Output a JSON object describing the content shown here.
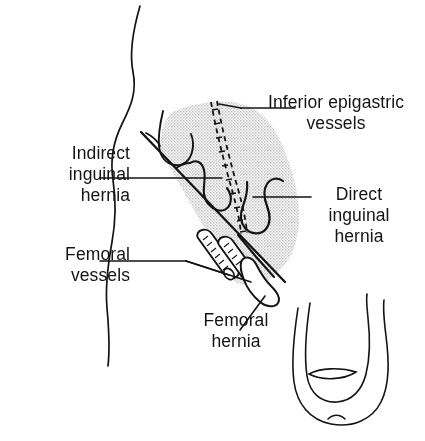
{
  "figure": {
    "type": "medical-line-drawing",
    "background_color": "#ffffff",
    "ink_color": "#141414",
    "shade_color": "#d6d6d6",
    "width": 425,
    "height": 441
  },
  "labels": {
    "indirect_inguinal_hernia": "Indirect\ninguinal\nhernia",
    "femoral_vessels": "Femoral\nvessels",
    "inferior_epigastric_vessels": "Inferior epigastric\nvessels",
    "direct_inguinal_hernia": "Direct\ninguinal\nhernia",
    "femoral_hernia": "Femoral\nhernia"
  },
  "structures": [
    {
      "name": "body-contour",
      "description": "wavy vertical torso/flank outline on the left side"
    },
    {
      "name": "inguinal-ligament",
      "description": "strong diagonal line running from upper-left to lower-right"
    },
    {
      "name": "shaded-region",
      "description": "stippled parallelogram of the inguinal region above the ligament",
      "color": "#d6d6d6"
    },
    {
      "name": "inferior-epigastric-vessels",
      "description": "paired dashed ladder-like vessel pair crossing the shaded region diagonally"
    },
    {
      "name": "indirect-hernia-sac",
      "description": "wavy sac outline lateral to the epigastric vessels"
    },
    {
      "name": "direct-hernia-sac",
      "description": "wavy sac outline medial to the epigastric vessels"
    },
    {
      "name": "internal-ring-hook",
      "description": "hook-shaped open curve at the upper-left of the shaded region"
    },
    {
      "name": "femoral-vessels",
      "description": "two hatched cylindrical tubes with elliptical cut ends below the ligament"
    },
    {
      "name": "femoral-hernia-bulge",
      "description": "rounded bulge inferior and lateral to the femoral vessels"
    },
    {
      "name": "scrotum-outline",
      "description": "U-shaped double outline with lens shape at lower right"
    }
  ],
  "leaders": [
    {
      "name": "leader-indirect",
      "from": "label",
      "to": "indirect-hernia-sac"
    },
    {
      "name": "leader-femoral-vessels",
      "from": "label",
      "to": "femoral-vessels",
      "branches": 2
    },
    {
      "name": "leader-inferior-epigastric",
      "from": "label",
      "to": "inferior-epigastric-vessels"
    },
    {
      "name": "leader-direct",
      "from": "label",
      "to": "direct-hernia-sac"
    },
    {
      "name": "leader-femoral-hernia",
      "from": "label",
      "to": "femoral-hernia-bulge"
    }
  ]
}
